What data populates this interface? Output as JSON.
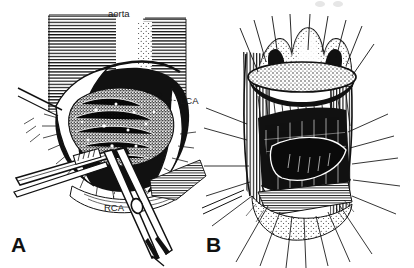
{
  "figure": {
    "background_color": "#ffffff",
    "ink_color": "#111111",
    "style": "black-and-white pen-and-ink surgical line drawing"
  },
  "panels": [
    {
      "letter": "A",
      "name": "aortotomy-exposure",
      "caption": "Aortotomy with exposure of calcified native aortic valve",
      "annotations": [
        {
          "text": "aorta",
          "name": "aorta-label",
          "x": 108,
          "y": 9
        },
        {
          "text": "LCA",
          "name": "lca-label",
          "x": 180,
          "y": 96
        },
        {
          "text": "RCA",
          "name": "rca-label",
          "x": 104,
          "y": 203
        }
      ],
      "instruments": [
        "forceps",
        "retractor-blade",
        "scissors"
      ]
    },
    {
      "letter": "B",
      "name": "prosthetic-valve-seating",
      "caption": "Prosthetic valve lowered into the annulus on radiating sutures",
      "annotations": [],
      "instruments": [
        "suture-lines"
      ]
    }
  ],
  "labels": {
    "panel_a_letter": "A",
    "panel_b_letter": "B",
    "aorta": "aorta",
    "lca": "LCA",
    "rca": "RCA"
  }
}
